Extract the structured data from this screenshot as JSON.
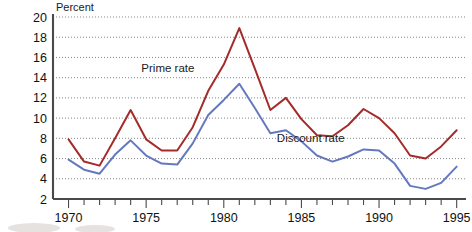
{
  "chart_data": {
    "type": "line",
    "title": "",
    "xlabel": "",
    "ylabel": "Percent",
    "ylim": [
      2,
      20
    ],
    "xlim": [
      1969,
      1995.6
    ],
    "ytick_step": 2,
    "yticks": [
      2,
      4,
      6,
      8,
      10,
      12,
      14,
      16,
      18,
      20
    ],
    "xticks": [
      1970,
      1971,
      1972,
      1973,
      1974,
      1975,
      1976,
      1977,
      1978,
      1979,
      1980,
      1981,
      1982,
      1983,
      1984,
      1985,
      1986,
      1987,
      1988,
      1989,
      1990,
      1991,
      1992,
      1993,
      1994,
      1995
    ],
    "xtick_labels": [
      "1970",
      "",
      "",
      "",
      "",
      "1975",
      "",
      "",
      "",
      "",
      "1980",
      "",
      "",
      "",
      "",
      "1985",
      "",
      "",
      "",
      "",
      "1990",
      "",
      "",
      "",
      "",
      "1995"
    ],
    "xtick_labels_major": [
      "1970",
      "1975",
      "1980",
      "1985",
      "1990",
      "1995"
    ],
    "xticks_major": [
      1970,
      1975,
      1980,
      1985,
      1990,
      1995
    ],
    "grid": true,
    "grid_axis": "y",
    "legend_position": "inline-annotation",
    "x": [
      1970,
      1971,
      1972,
      1973,
      1974,
      1975,
      1976,
      1977,
      1978,
      1979,
      1980,
      1981,
      1982,
      1983,
      1984,
      1985,
      1986,
      1987,
      1988,
      1989,
      1990,
      1991,
      1992,
      1993,
      1994,
      1995
    ],
    "series": [
      {
        "name": "Prime rate",
        "color": "#a52a2a",
        "label_x": 1976.4,
        "label_y": 14.6,
        "values": [
          7.9,
          5.7,
          5.3,
          8.0,
          10.8,
          7.9,
          6.8,
          6.8,
          9.1,
          12.7,
          15.3,
          18.9,
          14.9,
          10.8,
          12.0,
          9.9,
          8.3,
          8.2,
          9.3,
          10.9,
          10.0,
          8.5,
          6.3,
          6.0,
          7.2,
          8.8
        ]
      },
      {
        "name": "Discount rate",
        "color": "#6478bf",
        "label_x": 1985.6,
        "label_y": 7.6,
        "values": [
          5.9,
          4.9,
          4.5,
          6.4,
          7.8,
          6.3,
          5.5,
          5.4,
          7.5,
          10.3,
          11.8,
          13.4,
          11.0,
          8.5,
          8.8,
          7.7,
          6.3,
          5.7,
          6.2,
          6.9,
          6.8,
          5.5,
          3.3,
          3.0,
          3.6,
          5.2
        ]
      }
    ]
  },
  "axis": {
    "y_axis_title": "Percent"
  }
}
